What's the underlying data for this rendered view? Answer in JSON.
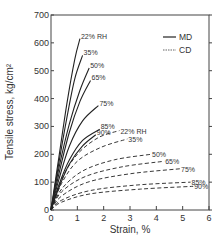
{
  "chart_data": {
    "type": "line",
    "title": "",
    "xlabel": "Strain, %",
    "ylabel": "Tensile stress, kg/cm²",
    "xlim": [
      0,
      6
    ],
    "ylim": [
      0,
      700
    ],
    "xticks": [
      0,
      1,
      2,
      3,
      4,
      5,
      6
    ],
    "yticks": [
      0,
      100,
      200,
      300,
      400,
      500,
      600,
      700
    ],
    "grid": false,
    "legend": {
      "position": "upper right",
      "entries": [
        {
          "label": "MD",
          "style": "solid"
        },
        {
          "label": "CD",
          "style": "dashed"
        }
      ]
    },
    "series": [
      {
        "name": "MD 22% RH",
        "direction": "MD",
        "label": "22% RH",
        "style": "solid",
        "x": [
          0,
          0.3,
          0.6,
          0.9,
          1.1
        ],
        "y": [
          0,
          190,
          380,
          540,
          615
        ]
      },
      {
        "name": "MD 35% RH",
        "direction": "MD",
        "label": "35%",
        "style": "solid",
        "x": [
          0,
          0.3,
          0.6,
          0.9,
          1.2
        ],
        "y": [
          0,
          170,
          330,
          470,
          555
        ]
      },
      {
        "name": "MD 50% RH",
        "direction": "MD",
        "label": "50%",
        "style": "solid",
        "x": [
          0,
          0.3,
          0.7,
          1.1,
          1.45
        ],
        "y": [
          0,
          150,
          310,
          430,
          510
        ]
      },
      {
        "name": "MD 65% RH",
        "direction": "MD",
        "label": "65%",
        "style": "solid",
        "x": [
          0,
          0.3,
          0.7,
          1.1,
          1.5
        ],
        "y": [
          0,
          130,
          280,
          390,
          465
        ]
      },
      {
        "name": "MD 75% RH",
        "direction": "MD",
        "label": "75%",
        "style": "solid",
        "x": [
          0,
          0.3,
          0.7,
          1.2,
          1.8
        ],
        "y": [
          0,
          110,
          230,
          320,
          375
        ]
      },
      {
        "name": "MD 85% RH",
        "direction": "MD",
        "label": "85%",
        "style": "solid",
        "x": [
          0,
          0.3,
          0.7,
          1.2,
          1.85
        ],
        "y": [
          0,
          90,
          180,
          250,
          290
        ]
      },
      {
        "name": "MD 90% RH",
        "direction": "MD",
        "label": "90%",
        "style": "solid",
        "x": [
          0,
          0.3,
          0.7,
          1.2,
          1.7
        ],
        "y": [
          0,
          80,
          165,
          230,
          270
        ]
      },
      {
        "name": "CD 22% RH",
        "direction": "CD",
        "label": "22% RH",
        "style": "dashed",
        "x": [
          0,
          0.4,
          1.0,
          1.8,
          2.6
        ],
        "y": [
          0,
          110,
          200,
          260,
          285
        ]
      },
      {
        "name": "CD 35% RH",
        "direction": "CD",
        "label": "35%",
        "style": "dashed",
        "x": [
          0,
          0.4,
          1.0,
          1.9,
          2.9
        ],
        "y": [
          0,
          95,
          175,
          225,
          255
        ]
      },
      {
        "name": "CD 50% RH",
        "direction": "CD",
        "label": "50%",
        "style": "dashed",
        "x": [
          0,
          0.4,
          1.2,
          2.4,
          3.8
        ],
        "y": [
          0,
          75,
          140,
          180,
          200
        ]
      },
      {
        "name": "CD 65% RH",
        "direction": "CD",
        "label": "65%",
        "style": "dashed",
        "x": [
          0,
          0.4,
          1.3,
          2.7,
          4.3
        ],
        "y": [
          0,
          65,
          120,
          155,
          175
        ]
      },
      {
        "name": "CD 75% RH",
        "direction": "CD",
        "label": "75%",
        "style": "dashed",
        "x": [
          0,
          0.4,
          1.4,
          3.0,
          4.9
        ],
        "y": [
          0,
          50,
          100,
          130,
          148
        ]
      },
      {
        "name": "CD 85% RH",
        "direction": "CD",
        "label": "85%",
        "style": "dashed",
        "x": [
          0,
          0.4,
          1.5,
          3.3,
          5.3
        ],
        "y": [
          0,
          35,
          70,
          90,
          100
        ]
      },
      {
        "name": "CD 90% RH",
        "direction": "CD",
        "label": "90%",
        "style": "dashed",
        "x": [
          0,
          0.4,
          1.5,
          3.4,
          5.4
        ],
        "y": [
          0,
          28,
          58,
          75,
          85
        ]
      }
    ]
  }
}
